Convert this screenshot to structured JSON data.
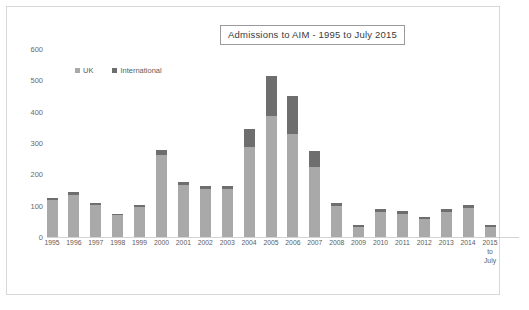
{
  "chart_data": {
    "type": "bar",
    "title": "Admissions to AIM - 1995 to July 2015",
    "xlabel": "",
    "ylabel": "",
    "ylim": [
      0,
      600
    ],
    "yticks": [
      0,
      100,
      200,
      300,
      400,
      500,
      600
    ],
    "grid": false,
    "stacked": true,
    "legend_position": "top-left",
    "categories": [
      "1995",
      "1996",
      "1997",
      "1998",
      "1999",
      "2000",
      "2001",
      "2002",
      "2003",
      "2004",
      "2005",
      "2006",
      "2007",
      "2008",
      "2009",
      "2010",
      "2011",
      "2012",
      "2013",
      "2014",
      "2015\nto\nJuly"
    ],
    "category_labels": [
      [
        "1995"
      ],
      [
        "1996"
      ],
      [
        "1997"
      ],
      [
        "1998"
      ],
      [
        "1999"
      ],
      [
        "2000"
      ],
      [
        "2001"
      ],
      [
        "2002"
      ],
      [
        "2003"
      ],
      [
        "2004"
      ],
      [
        "2005"
      ],
      [
        "2006"
      ],
      [
        "2007"
      ],
      [
        "2008"
      ],
      [
        "2009"
      ],
      [
        "2010"
      ],
      [
        "2011"
      ],
      [
        "2012"
      ],
      [
        "2013"
      ],
      [
        "2014"
      ],
      [
        "2015",
        "to",
        "July"
      ]
    ],
    "series": [
      {
        "name": "UK",
        "color": "#a9a9a9",
        "values": [
          117,
          133,
          101,
          70,
          96,
          262,
          167,
          153,
          154,
          287,
          385,
          330,
          225,
          100,
          33,
          80,
          72,
          58,
          80,
          92,
          33
        ]
      },
      {
        "name": "International",
        "color": "#6e6e6e",
        "values": [
          6,
          12,
          6,
          5,
          6,
          15,
          10,
          9,
          8,
          58,
          130,
          120,
          50,
          10,
          5,
          10,
          10,
          7,
          10,
          11,
          5
        ]
      }
    ],
    "totals": [
      123,
      145,
      107,
      75,
      102,
      277,
      177,
      162,
      162,
      345,
      515,
      450,
      275,
      110,
      38,
      90,
      82,
      65,
      90,
      103,
      38
    ]
  },
  "legend": {
    "items": [
      {
        "label": "UK",
        "color": "#a9a9a9"
      },
      {
        "label": "International",
        "color": "#6e6e6e"
      }
    ]
  }
}
